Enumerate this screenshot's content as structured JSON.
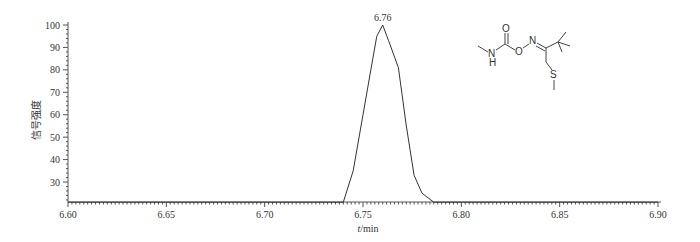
{
  "chart_data": {
    "type": "line",
    "title": "",
    "xlabel": "t/min",
    "ylabel": "信号强度",
    "xlim": [
      6.6,
      6.9
    ],
    "ylim": [
      21,
      100
    ],
    "xticks": [
      "6.60",
      "6.65",
      "6.70",
      "6.75",
      "6.80",
      "6.85",
      "6.90"
    ],
    "yticks": [
      "30",
      "40",
      "50",
      "60",
      "70",
      "80",
      "90",
      "100"
    ],
    "grid": false,
    "legend": null,
    "annotations": [
      {
        "text": "6.76",
        "x": 6.76,
        "y": 100
      }
    ],
    "series": [
      {
        "name": "chromatogram",
        "x": [
          6.6,
          6.74,
          6.745,
          6.75,
          6.755,
          6.757,
          6.76,
          6.763,
          6.768,
          6.772,
          6.776,
          6.78,
          6.786,
          6.9
        ],
        "y": [
          21,
          21,
          35,
          60,
          85,
          95,
          100,
          93,
          81,
          55,
          33,
          25,
          21,
          21
        ]
      }
    ]
  },
  "labels": {
    "peak": "6.76",
    "xlabel_italic": "t",
    "xlabel_rest": "/min",
    "ylabel": "信号强度"
  },
  "molecule": {
    "name": "thiofanox-like oxime carbamate",
    "atoms": [
      "O",
      "N",
      "O",
      "N",
      "H",
      "S"
    ]
  }
}
